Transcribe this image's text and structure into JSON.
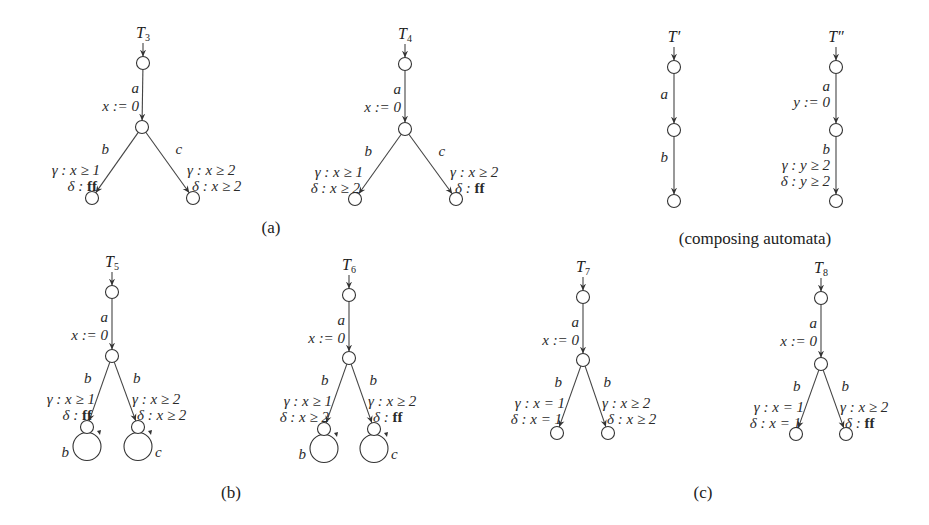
{
  "automata": [
    {
      "id": "T3",
      "title": "T",
      "subscript": "3",
      "nodes": {
        "top": [
          143,
          63
        ],
        "mid": [
          142,
          127
        ],
        "left": [
          92,
          198
        ],
        "right": [
          193,
          198
        ]
      },
      "edge_a": {
        "action": "a",
        "reset": "x := 0"
      },
      "edge_left": {
        "action": "b",
        "gamma": "γ : x ≥ 1",
        "delta": "δ : ",
        "delta_val": "ff",
        "delta_bold": true
      },
      "edge_right": {
        "action": "c",
        "gamma": "γ : x ≥ 2",
        "delta": "δ : x ≥ 2",
        "delta_val": "",
        "delta_bold": false
      },
      "loops": false
    },
    {
      "id": "T4",
      "title": "T",
      "subscript": "4",
      "nodes": {
        "top": [
          405,
          64
        ],
        "mid": [
          405,
          129
        ],
        "left": [
          355,
          199
        ],
        "right": [
          456,
          199
        ]
      },
      "edge_a": {
        "action": "a",
        "reset": "x := 0"
      },
      "edge_left": {
        "action": "b",
        "gamma": "γ : x ≥ 1",
        "delta": "δ : x ≥ 2",
        "delta_val": "",
        "delta_bold": false
      },
      "edge_right": {
        "action": "c",
        "gamma": "γ : x ≥ 2",
        "delta": "δ : ",
        "delta_val": "ff",
        "delta_bold": true
      },
      "loops": false
    },
    {
      "id": "T5",
      "title": "T",
      "subscript": "5",
      "nodes": {
        "top": [
          112,
          292
        ],
        "mid": [
          112,
          356
        ],
        "left": [
          87,
          427
        ],
        "right": [
          138,
          427
        ]
      },
      "edge_a": {
        "action": "a",
        "reset": "x := 0"
      },
      "edge_left": {
        "action": "b",
        "gamma": "γ : x ≥ 1",
        "delta": "δ : ",
        "delta_val": "ff",
        "delta_bold": true
      },
      "edge_right": {
        "action": "b",
        "gamma": "γ : x ≥ 2",
        "delta": "δ : x ≥ 2",
        "delta_val": "",
        "delta_bold": false
      },
      "loops": true,
      "loop_left": "b",
      "loop_right": "c"
    },
    {
      "id": "T6",
      "title": "T",
      "subscript": "6",
      "nodes": {
        "top": [
          349,
          295
        ],
        "mid": [
          349,
          358
        ],
        "left": [
          324,
          429
        ],
        "right": [
          374,
          429
        ]
      },
      "edge_a": {
        "action": "a",
        "reset": "x := 0"
      },
      "edge_left": {
        "action": "b",
        "gamma": "γ : x ≥ 1",
        "delta": "δ : x ≥ 2",
        "delta_val": "",
        "delta_bold": false
      },
      "edge_right": {
        "action": "b",
        "gamma": "γ : x ≥ 2",
        "delta": "δ : ",
        "delta_val": "ff",
        "delta_bold": true
      },
      "loops": true,
      "loop_left": "b",
      "loop_right": "c"
    },
    {
      "id": "T7",
      "title": "T",
      "subscript": "7",
      "nodes": {
        "top": [
          583,
          297
        ],
        "mid": [
          583,
          360
        ],
        "left": [
          557,
          433
        ],
        "right": [
          608,
          433
        ]
      },
      "edge_a": {
        "action": "a",
        "reset": "x := 0"
      },
      "edge_left": {
        "action": "b",
        "gamma": "γ : x = 1",
        "delta": "δ : x = 1",
        "delta_val": "",
        "delta_bold": false
      },
      "edge_right": {
        "action": "b",
        "gamma": "γ : x ≥ 2",
        "delta": "δ : x ≥ 2",
        "delta_val": "",
        "delta_bold": false
      },
      "loops": false
    },
    {
      "id": "T8",
      "title": "T",
      "subscript": "8",
      "nodes": {
        "top": [
          821,
          298
        ],
        "mid": [
          821,
          364
        ],
        "left": [
          796,
          434
        ],
        "right": [
          846,
          434
        ]
      },
      "edge_a": {
        "action": "a",
        "reset": "x := 0"
      },
      "edge_left": {
        "action": "b",
        "gamma": "γ : x = 1",
        "delta": "δ : x = 1",
        "delta_val": "",
        "delta_bold": false
      },
      "edge_right": {
        "action": "b",
        "gamma": "γ : x ≥ 2",
        "delta": "δ : ",
        "delta_val": "ff",
        "delta_bold": true
      },
      "loops": false
    }
  ],
  "composing": [
    {
      "id": "T-prime",
      "title": "T′",
      "nodes": [
        [
          674,
          67
        ],
        [
          674,
          130
        ],
        [
          674,
          201
        ]
      ],
      "edges": [
        {
          "lines": [
            "a"
          ]
        },
        {
          "lines": [
            "b"
          ]
        }
      ]
    },
    {
      "id": "T-double-prime",
      "title": "T″",
      "nodes": [
        [
          836,
          67
        ],
        [
          836,
          130
        ],
        [
          836,
          201
        ]
      ],
      "edges": [
        {
          "lines": [
            "a",
            "y := 0"
          ]
        },
        {
          "lines": [
            "b",
            "γ : y ≥ 2",
            "δ : y ≥ 2"
          ]
        }
      ]
    }
  ],
  "captions": {
    "a": {
      "text": "(a)",
      "pos": [
        271,
        233
      ]
    },
    "composing": {
      "text": "(composing automata)",
      "pos": [
        755,
        244
      ]
    },
    "b": {
      "text": "(b)",
      "pos": [
        231,
        498
      ]
    },
    "c": {
      "text": "(c)",
      "pos": [
        703,
        498
      ]
    }
  },
  "colors": {
    "stroke": "#333333",
    "text": "#2a2a2a",
    "background": "#ffffff"
  }
}
